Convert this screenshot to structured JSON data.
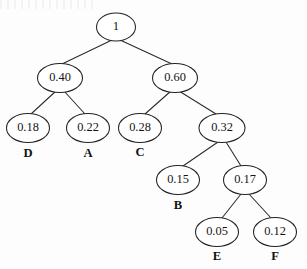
{
  "document": {
    "kind": "huffman-tree-diagram",
    "background_color": "#fdfdfd",
    "stroke_color": "#222222",
    "text_color": "#141414"
  },
  "chart_data": {
    "type": "diagram",
    "subtype": "binary-tree",
    "title": "",
    "xlabel": "",
    "ylabel": "",
    "orientation": "top-down",
    "node_shape": "ellipse",
    "nodes": [
      {
        "id": "n_root",
        "value": "1",
        "cx": 116,
        "cy": 27,
        "rx": 19.5,
        "ry": 14.0,
        "leaf_label": "",
        "level": 0
      },
      {
        "id": "n_040",
        "value": "0.40",
        "cx": 60,
        "cy": 78,
        "rx": 22.5,
        "ry": 14.5,
        "leaf_label": "",
        "level": 1
      },
      {
        "id": "n_060",
        "value": "0.60",
        "cx": 175,
        "cy": 78,
        "rx": 22.5,
        "ry": 14.5,
        "leaf_label": "",
        "level": 1
      },
      {
        "id": "n_018",
        "value": "0.18",
        "cx": 28,
        "cy": 128,
        "rx": 21.5,
        "ry": 14.5,
        "leaf_label": "D",
        "level": 2
      },
      {
        "id": "n_022",
        "value": "0.22",
        "cx": 88,
        "cy": 128,
        "rx": 21.5,
        "ry": 14.5,
        "leaf_label": "A",
        "level": 2
      },
      {
        "id": "n_028",
        "value": "0.28",
        "cx": 140,
        "cy": 128,
        "rx": 21.5,
        "ry": 14.5,
        "leaf_label": "C",
        "level": 2
      },
      {
        "id": "n_032",
        "value": "0.32",
        "cx": 222,
        "cy": 128,
        "rx": 23.0,
        "ry": 14.5,
        "leaf_label": "",
        "level": 2
      },
      {
        "id": "n_015",
        "value": "0.15",
        "cx": 178,
        "cy": 180,
        "rx": 21.5,
        "ry": 14.5,
        "leaf_label": "B",
        "level": 3
      },
      {
        "id": "n_017",
        "value": "0.17",
        "cx": 245,
        "cy": 180,
        "rx": 21.5,
        "ry": 14.5,
        "leaf_label": "",
        "level": 3
      },
      {
        "id": "n_005",
        "value": "0.05",
        "cx": 217,
        "cy": 232,
        "rx": 21.5,
        "ry": 14.5,
        "leaf_label": "E",
        "level": 4
      },
      {
        "id": "n_012",
        "value": "0.12",
        "cx": 275,
        "cy": 232,
        "rx": 21.5,
        "ry": 14.5,
        "leaf_label": "F",
        "level": 4
      }
    ],
    "edges": [
      {
        "from": "n_root",
        "to": "n_040",
        "x1": 112,
        "y1": 40,
        "x2": 62,
        "y2": 64
      },
      {
        "from": "n_root",
        "to": "n_060",
        "x1": 120,
        "y1": 40,
        "x2": 172,
        "y2": 64
      },
      {
        "from": "n_040",
        "to": "n_018",
        "x1": 56,
        "y1": 91,
        "x2": 31,
        "y2": 114
      },
      {
        "from": "n_040",
        "to": "n_022",
        "x1": 64,
        "y1": 91,
        "x2": 85,
        "y2": 114
      },
      {
        "from": "n_060",
        "to": "n_028",
        "x1": 171,
        "y1": 91,
        "x2": 145,
        "y2": 114
      },
      {
        "from": "n_060",
        "to": "n_032",
        "x1": 179,
        "y1": 91,
        "x2": 216,
        "y2": 114
      },
      {
        "from": "n_032",
        "to": "n_015",
        "x1": 218,
        "y1": 142,
        "x2": 183,
        "y2": 166
      },
      {
        "from": "n_032",
        "to": "n_017",
        "x1": 226,
        "y1": 142,
        "x2": 241,
        "y2": 166
      },
      {
        "from": "n_017",
        "to": "n_005",
        "x1": 241,
        "y1": 194,
        "x2": 222,
        "y2": 218
      },
      {
        "from": "n_017",
        "to": "n_012",
        "x1": 249,
        "y1": 194,
        "x2": 271,
        "y2": 218
      }
    ],
    "leaf_labels": [
      {
        "text": "D",
        "x": 28,
        "y": 154
      },
      {
        "text": "A",
        "x": 88,
        "y": 154
      },
      {
        "text": "C",
        "x": 140,
        "y": 153
      },
      {
        "text": "B",
        "x": 178,
        "y": 206
      },
      {
        "text": "E",
        "x": 217,
        "y": 257
      },
      {
        "text": "F",
        "x": 275,
        "y": 257
      }
    ],
    "symbols": [
      "D",
      "A",
      "C",
      "B",
      "E",
      "F"
    ],
    "probabilities": [
      0.18,
      0.22,
      0.28,
      0.15,
      0.05,
      0.12
    ],
    "internal_values": [
      1,
      0.4,
      0.6,
      0.32,
      0.17
    ],
    "legend": [],
    "annotations": []
  }
}
